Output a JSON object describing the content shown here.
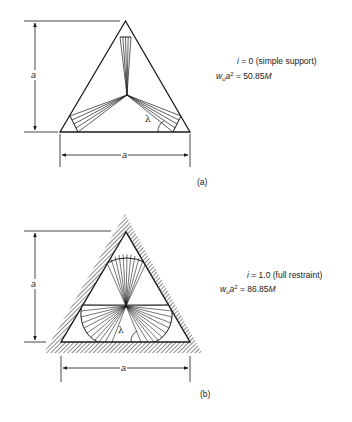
{
  "figure": {
    "panels": [
      {
        "id": "a",
        "caption": "(a)",
        "condition_var": "i",
        "condition_text": " = 0 (simple support)",
        "result_var_w": "w",
        "result_sub": "u",
        "result_var_a": "a",
        "result_sup": "2",
        "result_eq": " = 50.85",
        "result_unit": "M",
        "dim_height_label": "a",
        "dim_width_label": "a",
        "angle_label": "λ",
        "support": "simple"
      },
      {
        "id": "b",
        "caption": "(b)",
        "condition_var": "i",
        "condition_text": " = 1.0 (full restraint)",
        "result_var_w": "w",
        "result_sub": "u",
        "result_var_a": "a",
        "result_sup": "2",
        "result_eq": " = 86.85",
        "result_unit": "M",
        "dim_height_label": "a",
        "dim_width_label": "a",
        "angle_label": "λ",
        "support": "fixed (hatched)"
      }
    ],
    "colors": {
      "line": "#1a1a1a",
      "background": "#ffffff"
    }
  }
}
